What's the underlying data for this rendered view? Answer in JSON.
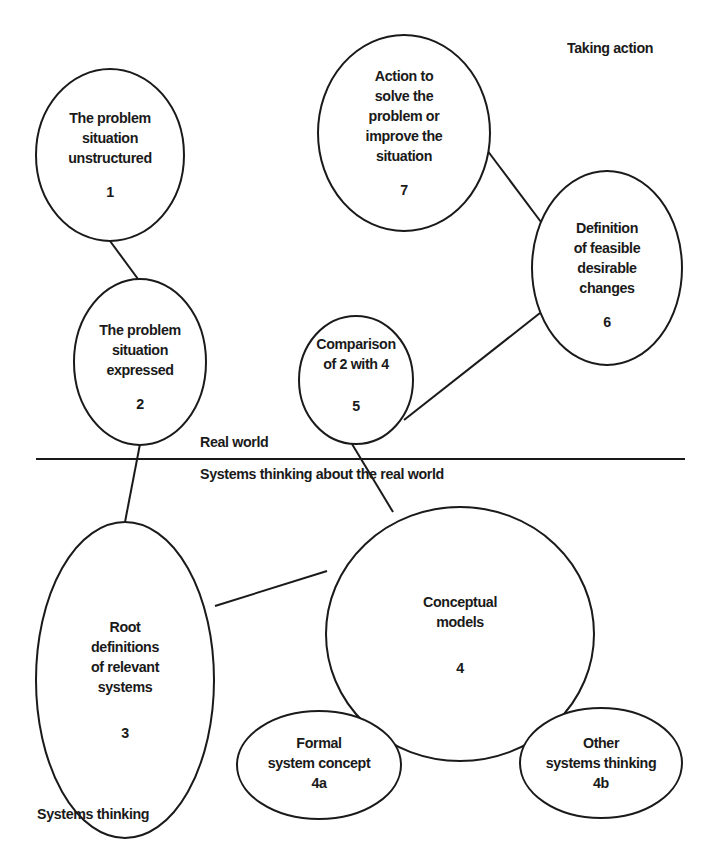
{
  "diagram": {
    "type": "soft-systems-methodology",
    "regions": {
      "top_label": "Real world",
      "bottom_label": "Systems thinking about the real world",
      "corner_top_right": "Taking action",
      "corner_bottom_left": "Systems thinking"
    },
    "nodes": [
      {
        "id": "1",
        "lines": [
          "The problem",
          "situation",
          "unstructured"
        ],
        "number": "1"
      },
      {
        "id": "2",
        "lines": [
          "The problem",
          "situation",
          "expressed"
        ],
        "number": "2"
      },
      {
        "id": "3",
        "lines": [
          "Root",
          "definitions",
          "of relevant",
          "systems"
        ],
        "number": "3"
      },
      {
        "id": "4",
        "lines": [
          "Conceptual",
          "models"
        ],
        "number": "4"
      },
      {
        "id": "4a",
        "lines": [
          "Formal",
          "system concept"
        ],
        "number": "4a"
      },
      {
        "id": "4b",
        "lines": [
          "Other",
          "systems thinking"
        ],
        "number": "4b"
      },
      {
        "id": "5",
        "lines": [
          "Comparison",
          "of 2 with 4"
        ],
        "number": "5"
      },
      {
        "id": "6",
        "lines": [
          "Definition",
          "of feasible",
          "desirable",
          "changes"
        ],
        "number": "6"
      },
      {
        "id": "7",
        "lines": [
          "Action to",
          "solve the",
          "problem or",
          "improve the",
          "situation"
        ],
        "number": "7"
      }
    ],
    "edges": [
      [
        "1",
        "2"
      ],
      [
        "2",
        "3"
      ],
      [
        "3",
        "4"
      ],
      [
        "4",
        "4a"
      ],
      [
        "4",
        "4b"
      ],
      [
        "4",
        "5"
      ],
      [
        "5",
        "6"
      ],
      [
        "6",
        "7"
      ]
    ]
  }
}
